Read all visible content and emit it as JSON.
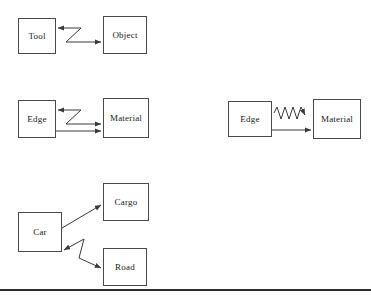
{
  "figure": {
    "background_color": "#ffffff",
    "line_color": "#4a4a4a",
    "arrow_color": "#3a3a3a",
    "text_color": "#1a1a1a",
    "rule_color": "#2b2b2b"
  },
  "groups": [
    {
      "id": "tool-object",
      "nodes": [
        {
          "id": "tool",
          "label": "Tool",
          "x": 18,
          "y": 18,
          "w": 38,
          "h": 36
        },
        {
          "id": "object",
          "label": "Object",
          "x": 103,
          "y": 16,
          "w": 44,
          "h": 38
        }
      ],
      "connectors": [
        {
          "id": "tool-object-zigzag",
          "kind": "zigzag-bidirectional"
        }
      ]
    },
    {
      "id": "edge-material-left",
      "nodes": [
        {
          "id": "edge-left",
          "label": "Edge",
          "x": 18,
          "y": 100,
          "w": 38,
          "h": 38
        },
        {
          "id": "material-left",
          "label": "Material",
          "x": 103,
          "y": 98,
          "w": 46,
          "h": 40
        }
      ],
      "connectors": [
        {
          "id": "edge-material-zigzag",
          "kind": "zigzag-bidirectional"
        },
        {
          "id": "edge-material-straight",
          "kind": "straight-arrow"
        }
      ]
    },
    {
      "id": "edge-material-right",
      "nodes": [
        {
          "id": "edge-right",
          "label": "Edge",
          "x": 228,
          "y": 101,
          "w": 44,
          "h": 36
        },
        {
          "id": "material-right",
          "label": "Material",
          "x": 313,
          "y": 99,
          "w": 48,
          "h": 40
        }
      ],
      "connectors": [
        {
          "id": "edge-material-wave",
          "kind": "sawtooth-wave-arrow"
        },
        {
          "id": "edge-material-straight-right",
          "kind": "straight-arrow"
        }
      ]
    },
    {
      "id": "car-cargo-road",
      "nodes": [
        {
          "id": "car",
          "label": "Car",
          "x": 18,
          "y": 212,
          "w": 44,
          "h": 40
        },
        {
          "id": "cargo",
          "label": "Cargo",
          "x": 103,
          "y": 183,
          "w": 46,
          "h": 38
        },
        {
          "id": "road",
          "label": "Road",
          "x": 103,
          "y": 248,
          "w": 44,
          "h": 38
        }
      ],
      "connectors": [
        {
          "id": "car-cargo-arrow",
          "kind": "straight-arrow"
        },
        {
          "id": "car-road-zigzag",
          "kind": "zigzag-bidirectional"
        }
      ]
    }
  ],
  "rule": {
    "id": "bottom-rule",
    "x": 0,
    "y": 289,
    "w": 371,
    "h": 2
  }
}
